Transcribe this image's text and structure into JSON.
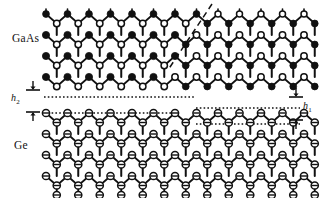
{
  "figure": {
    "type": "crystal-lattice-diagram",
    "width": 324,
    "height": 198,
    "background": "#ffffff",
    "line_color": "#111111"
  },
  "labels": {
    "upper_material": "GaAs",
    "lower_material": "Ge",
    "step_height_1": "h",
    "step_height_1_sub": "1",
    "step_height_2": "h",
    "step_height_2_sub": "2"
  },
  "legend": {
    "filled_circle": "group-V (As) atom, filled black circle",
    "open_circle": "group-III (Ga) atom, open white circle",
    "barred_circle": "Ge atom, open circle with horizontal bar"
  },
  "annotations": {
    "antiphase_boundary": "diagonal dashed line in upper-right GaAs region",
    "interface_levels": "horizontal dotted lines marking stepped GaAs/Ge interface",
    "step_h1_description": "single-layer step height at right side of interface",
    "step_h2_description": "double-layer step height at left side of interface"
  },
  "geometry": {
    "columns": 13,
    "gaas_rows": 4,
    "ge_rows": 4,
    "col_spacing": 21.5,
    "row_height": 21.0,
    "x_origin": 46,
    "gaas_top_y": 14,
    "ge_top_y": 113,
    "atom_radius_filled": 3.6,
    "atom_radius_open": 3.4,
    "atom_radius_ge": 3.6,
    "bond_width": 1.7,
    "interface_y_left": 97,
    "interface_y_right": 108,
    "ge_surface_y_left": 113,
    "ge_surface_y_right": 124,
    "apb_x_top": 212,
    "apb_y_top": 4,
    "apb_x_bottom": 168,
    "apb_y_bottom": 70
  },
  "markers": {
    "h2_arrow_top_y": 90,
    "h2_arrow_bottom_y": 112,
    "h2_arrow_x": 33,
    "h1_arrow_top_y": 97,
    "h1_arrow_bottom_y": 120,
    "h1_arrow_x": 296
  }
}
